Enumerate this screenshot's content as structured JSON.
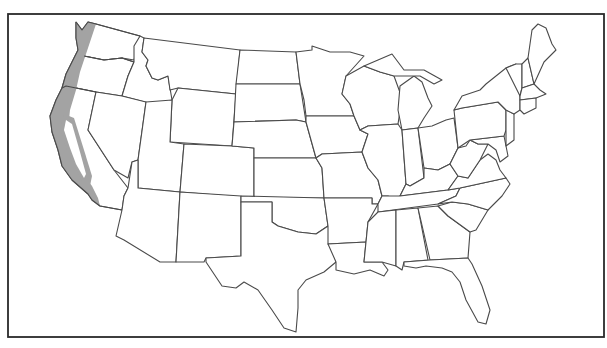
{
  "map": {
    "title": "",
    "subject": "Contiguous United States outline map",
    "colors": {
      "background": "#ffffff",
      "frame": "#2a2a2a",
      "state_border": "#4a4a4a",
      "shaded_region": "#a3a3a3"
    },
    "shaded_region": {
      "description": "Pacific coastal belt: western Washington, western Oregon, coastal California and the ring around the California Central Valley",
      "states": [
        "Washington",
        "Oregon",
        "California"
      ]
    },
    "states": [
      "Washington",
      "Oregon",
      "California",
      "Idaho",
      "Nevada",
      "Montana",
      "Wyoming",
      "Utah",
      "Arizona",
      "Colorado",
      "New Mexico",
      "North Dakota",
      "South Dakota",
      "Nebraska",
      "Kansas",
      "Oklahoma",
      "Texas",
      "Minnesota",
      "Iowa",
      "Missouri",
      "Arkansas",
      "Louisiana",
      "Wisconsin",
      "Illinois",
      "Michigan",
      "Indiana",
      "Ohio",
      "Kentucky",
      "Tennessee",
      "Mississippi",
      "Alabama",
      "Georgia",
      "Florida",
      "South Carolina",
      "North Carolina",
      "Virginia",
      "West Virginia",
      "Maryland",
      "Delaware",
      "Pennsylvania",
      "New Jersey",
      "New York",
      "Connecticut",
      "Rhode Island",
      "Massachusetts",
      "Vermont",
      "New Hampshire",
      "Maine"
    ],
    "labels_visible": false
  }
}
